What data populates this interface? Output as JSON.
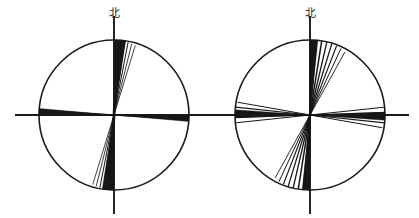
{
  "figure": {
    "width": 419,
    "height": 218,
    "background_color": "#ffffff",
    "line_color": "#1a1a1a",
    "petal_fill_color": "#181818"
  },
  "chart_data": [
    {
      "type": "rose",
      "title": "",
      "subtitle": "",
      "xlabel": "",
      "ylabel": "",
      "north_label": "北",
      "panel_index": 0,
      "panel_position": "left",
      "center": {
        "x": 114,
        "y": 115
      },
      "radius": 75,
      "axis_overshoot": 24,
      "grid": false,
      "legend": null,
      "annotations": [],
      "axis_ranges": {
        "azimuth_deg": [
          0,
          360
        ],
        "radius": [
          0,
          1
        ]
      },
      "axes": [
        {
          "name": "north-south-axis",
          "from_deg": 0,
          "to_deg": 180
        },
        {
          "name": "east-west-axis",
          "from_deg": 90,
          "to_deg": 270
        }
      ],
      "rays": [
        {
          "azimuth_deg": 2,
          "length_frac": 1.0,
          "width": 2.6
        },
        {
          "azimuth_deg": 5,
          "length_frac": 1.0,
          "width": 2.0
        },
        {
          "azimuth_deg": 8,
          "length_frac": 1.0,
          "width": 1.4
        },
        {
          "azimuth_deg": 11,
          "length_frac": 0.99,
          "width": 1.0
        },
        {
          "azimuth_deg": 14,
          "length_frac": 0.98,
          "width": 0.85
        },
        {
          "azimuth_deg": 17,
          "length_frac": 0.97,
          "width": 0.8
        },
        {
          "azimuth_deg": 182,
          "length_frac": 1.0,
          "width": 2.6
        },
        {
          "azimuth_deg": 185,
          "length_frac": 1.0,
          "width": 2.0
        },
        {
          "azimuth_deg": 188,
          "length_frac": 1.0,
          "width": 1.4
        },
        {
          "azimuth_deg": 191,
          "length_frac": 0.99,
          "width": 1.0
        },
        {
          "azimuth_deg": 194,
          "length_frac": 0.98,
          "width": 0.85
        },
        {
          "azimuth_deg": 197,
          "length_frac": 0.97,
          "width": 0.8
        },
        {
          "azimuth_deg": 92,
          "length_frac": 1.0,
          "width": 1.5
        },
        {
          "azimuth_deg": 94,
          "length_frac": 0.99,
          "width": 0.9
        },
        {
          "azimuth_deg": 272,
          "length_frac": 1.0,
          "width": 1.5
        },
        {
          "azimuth_deg": 274,
          "length_frac": 0.99,
          "width": 0.9
        }
      ],
      "wedges": [
        {
          "start_deg": 0,
          "end_deg": 9,
          "length_frac": 1.0
        },
        {
          "start_deg": 180,
          "end_deg": 189,
          "length_frac": 1.0
        },
        {
          "start_deg": 90,
          "end_deg": 95,
          "length_frac": 1.0
        },
        {
          "start_deg": 270,
          "end_deg": 275,
          "length_frac": 1.0
        }
      ]
    },
    {
      "type": "rose",
      "title": "",
      "subtitle": "",
      "xlabel": "",
      "ylabel": "",
      "north_label": "北",
      "panel_index": 1,
      "panel_position": "right",
      "center": {
        "x": 310,
        "y": 115
      },
      "radius": 75,
      "axis_overshoot": 24,
      "grid": false,
      "legend": null,
      "annotations": [],
      "axis_ranges": {
        "azimuth_deg": [
          0,
          360
        ],
        "radius": [
          0,
          1
        ]
      },
      "axes": [
        {
          "name": "north-south-axis",
          "from_deg": 0,
          "to_deg": 180
        },
        {
          "name": "east-west-axis",
          "from_deg": 90,
          "to_deg": 270
        }
      ],
      "rays": [
        {
          "azimuth_deg": 1,
          "length_frac": 1.0,
          "width": 2.2
        },
        {
          "azimuth_deg": 5,
          "length_frac": 1.0,
          "width": 1.6
        },
        {
          "azimuth_deg": 9,
          "length_frac": 1.0,
          "width": 1.5
        },
        {
          "azimuth_deg": 13,
          "length_frac": 1.0,
          "width": 1.3
        },
        {
          "azimuth_deg": 17,
          "length_frac": 0.99,
          "width": 1.2
        },
        {
          "azimuth_deg": 21,
          "length_frac": 0.99,
          "width": 1.1
        },
        {
          "azimuth_deg": 25,
          "length_frac": 0.98,
          "width": 1.0
        },
        {
          "azimuth_deg": 29,
          "length_frac": 0.96,
          "width": 0.9
        },
        {
          "azimuth_deg": 181,
          "length_frac": 1.0,
          "width": 2.2
        },
        {
          "azimuth_deg": 185,
          "length_frac": 1.0,
          "width": 1.6
        },
        {
          "azimuth_deg": 189,
          "length_frac": 1.0,
          "width": 1.5
        },
        {
          "azimuth_deg": 193,
          "length_frac": 1.0,
          "width": 1.3
        },
        {
          "azimuth_deg": 197,
          "length_frac": 0.99,
          "width": 1.2
        },
        {
          "azimuth_deg": 201,
          "length_frac": 0.99,
          "width": 1.1
        },
        {
          "azimuth_deg": 205,
          "length_frac": 0.98,
          "width": 1.0
        },
        {
          "azimuth_deg": 209,
          "length_frac": 0.96,
          "width": 0.9
        },
        {
          "azimuth_deg": 84,
          "length_frac": 0.99,
          "width": 1.0
        },
        {
          "azimuth_deg": 88,
          "length_frac": 1.0,
          "width": 1.2
        },
        {
          "azimuth_deg": 92,
          "length_frac": 1.0,
          "width": 1.3
        },
        {
          "azimuth_deg": 96,
          "length_frac": 1.0,
          "width": 1.2
        },
        {
          "azimuth_deg": 100,
          "length_frac": 0.98,
          "width": 1.0
        },
        {
          "azimuth_deg": 264,
          "length_frac": 0.99,
          "width": 1.0
        },
        {
          "azimuth_deg": 268,
          "length_frac": 1.0,
          "width": 1.2
        },
        {
          "azimuth_deg": 272,
          "length_frac": 1.0,
          "width": 1.3
        },
        {
          "azimuth_deg": 276,
          "length_frac": 1.0,
          "width": 1.2
        },
        {
          "azimuth_deg": 280,
          "length_frac": 0.98,
          "width": 1.0
        }
      ],
      "wedges": [
        {
          "start_deg": 0,
          "end_deg": 6,
          "length_frac": 1.0
        },
        {
          "start_deg": 180,
          "end_deg": 186,
          "length_frac": 1.0
        },
        {
          "start_deg": 88,
          "end_deg": 94,
          "length_frac": 1.0
        },
        {
          "start_deg": 268,
          "end_deg": 274,
          "length_frac": 1.0
        }
      ]
    }
  ]
}
